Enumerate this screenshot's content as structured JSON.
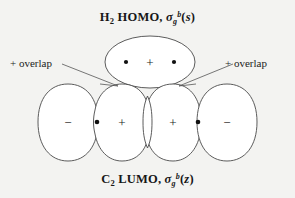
{
  "figure": {
    "background_color": "#f3f3f1",
    "stroke_color": "#4a4a4a",
    "text_color": "#1a1a1a"
  },
  "caption_top": {
    "molecule": "H",
    "molecule_sub": "2",
    "orbital_type": "HOMO",
    "separator": ", ",
    "symmetry_symbol": "σ",
    "symmetry_sub": "g",
    "symmetry_sup": "b",
    "open_paren": "(",
    "basis": "s",
    "close_paren": ")",
    "full_text": "H2 HOMO, σg^b(s)"
  },
  "caption_bottom": {
    "molecule": "C",
    "molecule_sub": "2",
    "orbital_type": "LUMO",
    "separator": ", ",
    "symmetry_symbol": "σ",
    "symmetry_sub": "g",
    "symmetry_sup": "b",
    "open_paren": "(",
    "basis": "z",
    "close_paren": ")",
    "full_text": "C2 LUMO, σg^b(z)"
  },
  "annotations": {
    "overlap_left": "+ overlap",
    "overlap_right": "+ overlap"
  },
  "diagram": {
    "top_orbital": {
      "name": "sigma-bonding-top-lobe",
      "sign": "+",
      "nuclei_count": 2
    },
    "lower_lobes": [
      {
        "name": "lobe-far-left",
        "sign": "−",
        "cx": 68,
        "has_nucleus": false
      },
      {
        "name": "lobe-inner-left",
        "sign": "+",
        "cx": 122,
        "has_nucleus": true
      },
      {
        "name": "lobe-inner-right",
        "sign": "+",
        "cx": 173,
        "has_nucleus": true
      },
      {
        "name": "lobe-far-right",
        "sign": "−",
        "cx": 227,
        "has_nucleus": false
      }
    ],
    "nucleus_positions": [
      {
        "x": 97,
        "y": 122
      },
      {
        "x": 198,
        "y": 122
      }
    ],
    "top_nucleus_positions": [
      {
        "x": 126,
        "y": 62
      },
      {
        "x": 174,
        "y": 62
      }
    ],
    "top_sign_position": {
      "x": 150,
      "y": 62
    }
  }
}
